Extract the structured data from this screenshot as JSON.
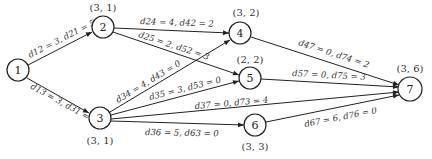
{
  "nodes": [
    {
      "id": "1",
      "label": "1",
      "x": 18,
      "y": 70,
      "coord": ""
    },
    {
      "id": "2",
      "label": "2",
      "x": 103,
      "y": 27,
      "coord": "(3, 1)"
    },
    {
      "id": "3",
      "label": "3",
      "x": 100,
      "y": 118,
      "coord": "(3, 1)"
    },
    {
      "id": "4",
      "label": "4",
      "x": 240,
      "y": 33,
      "coord": "(3, 2)"
    },
    {
      "id": "5",
      "label": "5",
      "x": 250,
      "y": 78,
      "coord": "(2, 2)"
    },
    {
      "id": "6",
      "label": "6",
      "x": 255,
      "y": 125,
      "coord": "(3, 3)"
    },
    {
      "id": "7",
      "label": "7",
      "x": 410,
      "y": 89,
      "coord": "(3, 6)"
    }
  ],
  "edges": [
    {
      "from": "1",
      "to": "2",
      "label": "d12 = 3, d21 = 5"
    },
    {
      "from": "1",
      "to": "3",
      "label": "d13 = 3, d31 = 4"
    },
    {
      "from": "2",
      "to": "4",
      "label": "d24 = 4, d42 = 2"
    },
    {
      "from": "2",
      "to": "5",
      "label": "d25 = 2, d52 = 3"
    },
    {
      "from": "3",
      "to": "4",
      "label": "d34 = 4, d43 = 0"
    },
    {
      "from": "3",
      "to": "5",
      "label": "d35 = 3, d53 = 0"
    },
    {
      "from": "3",
      "to": "7",
      "label": "d37 = 0, d73 = 4"
    },
    {
      "from": "3",
      "to": "6",
      "label": "d36 = 5, d63 = 0"
    },
    {
      "from": "4",
      "to": "7",
      "label": "d47 = 0, d74 = 2"
    },
    {
      "from": "5",
      "to": "7",
      "label": "d57 = 0, d75 = 3"
    },
    {
      "from": "6",
      "to": "7",
      "label": "d67 = 6, d76 = 0"
    }
  ]
}
